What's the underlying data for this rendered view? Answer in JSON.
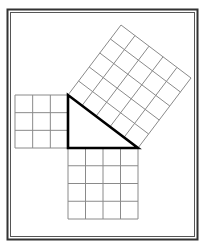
{
  "diagram": {
    "title": "Pythagorean theorem 3-4-5 right triangle with squares on each side",
    "background": "#ffffff",
    "frame": {
      "outer": {
        "x": 7.5,
        "y": 9.5,
        "w": 190,
        "h": 230,
        "stroke": "#333333",
        "width": 2
      },
      "inner": {
        "x": 10.5,
        "y": 12.5,
        "w": 184,
        "h": 224,
        "stroke": "#555555",
        "width": 1
      }
    },
    "unit_px": 17.6,
    "grid_color": "#8a8a8a",
    "triangle": {
      "stroke": "#000000",
      "stroke_width": 2.6,
      "vertices": {
        "right_angle": [
          68,
          148
        ],
        "top": [
          68,
          95
        ],
        "right": [
          138,
          148
        ]
      },
      "sides": {
        "vertical_leg": 3,
        "horizontal_leg": 4,
        "hypotenuse": 5
      }
    },
    "squares": [
      {
        "name": "leg-a-square",
        "side_units": 3,
        "area": 9,
        "origin": [
          68,
          95
        ],
        "u": [
          -17.6667,
          0
        ],
        "v": [
          0,
          17.6667
        ]
      },
      {
        "name": "leg-b-square",
        "side_units": 4,
        "area": 16,
        "origin": [
          68,
          148
        ],
        "u": [
          17.5,
          0
        ],
        "v": [
          0,
          17.75
        ]
      },
      {
        "name": "hypotenuse-square",
        "side_units": 5,
        "area": 25,
        "origin": [
          68,
          95
        ],
        "u": [
          14,
          10.6
        ],
        "v": [
          10.6,
          -14
        ]
      }
    ]
  }
}
